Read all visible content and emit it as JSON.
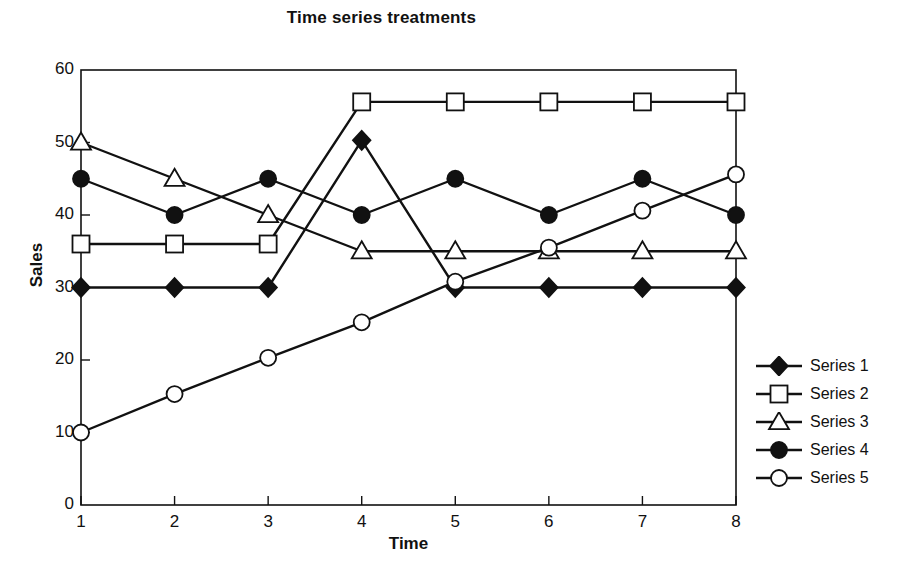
{
  "chart_data": {
    "type": "line",
    "title": "Time series treatments",
    "xlabel": "Time",
    "ylabel": "Sales",
    "x": [
      1,
      2,
      3,
      4,
      5,
      6,
      7,
      8
    ],
    "xticklabels": [
      "1",
      "2",
      "3",
      "4",
      "5",
      "6",
      "7",
      "8"
    ],
    "yticklabels": [
      "0",
      "10",
      "20",
      "30",
      "40",
      "50",
      "60"
    ],
    "yticks": [
      0,
      10,
      20,
      30,
      40,
      50,
      60
    ],
    "xlim": [
      1,
      8
    ],
    "ylim": [
      0,
      60
    ],
    "grid": false,
    "legend_position": "right",
    "series": [
      {
        "name": "Series 1",
        "marker": "filled-diamond",
        "values": [
          30,
          30,
          30,
          50.3,
          30,
          30,
          30,
          30
        ]
      },
      {
        "name": "Series 2",
        "marker": "open-square",
        "values": [
          36,
          36,
          36,
          55.6,
          55.6,
          55.6,
          55.6,
          55.6
        ]
      },
      {
        "name": "Series 3",
        "marker": "open-triangle",
        "values": [
          50,
          45,
          40,
          35,
          35,
          35,
          35,
          35
        ]
      },
      {
        "name": "Series 4",
        "marker": "filled-circle",
        "values": [
          45,
          40,
          45,
          40,
          45,
          40,
          45,
          40
        ]
      },
      {
        "name": "Series 5",
        "marker": "open-circle",
        "values": [
          10,
          15.3,
          20.3,
          25.2,
          30.8,
          35.5,
          40.6,
          45.6
        ]
      }
    ],
    "colors": {
      "line": "#111111",
      "marker_fill_open": "#ffffff",
      "marker_fill_solid": "#111111",
      "axis": "#111111",
      "background": "#ffffff"
    }
  }
}
